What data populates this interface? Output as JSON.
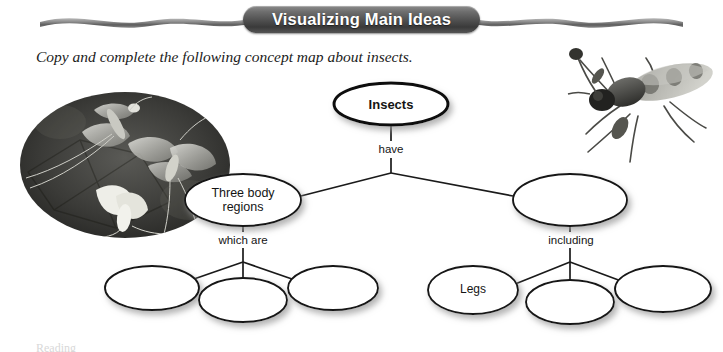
{
  "page": {
    "background": "#ffffff",
    "width": 723,
    "height": 352
  },
  "header": {
    "title": "Visualizing Main Ideas",
    "pill_color": "#4e4e4e",
    "text_color": "#ffffff",
    "ribbon_color": "#7c7c7c"
  },
  "instruction": {
    "text": "Copy and complete the following concept map about insects."
  },
  "images": {
    "left_photo": {
      "alt": "mayflies-photograph",
      "shape": "oval",
      "tone": "grayscale-dark"
    },
    "right_photo": {
      "alt": "long-legged-fly-photograph",
      "shape": "rectangle",
      "tone": "grayscale-light"
    }
  },
  "concept_map": {
    "root": {
      "label": "Insects"
    },
    "connectors": [
      {
        "id": "have",
        "label": "have"
      },
      {
        "id": "which-are",
        "label": "which are"
      },
      {
        "id": "including",
        "label": "including"
      }
    ],
    "level_two": [
      {
        "id": "three-body-regions",
        "label": "Three body\nregions",
        "filled": true
      },
      {
        "id": "level-two-blank",
        "label": "",
        "filled": false
      }
    ],
    "level_three_left": [
      {
        "id": "blank-l1",
        "label": "",
        "filled": false
      },
      {
        "id": "blank-l2",
        "label": "",
        "filled": false
      },
      {
        "id": "blank-l3",
        "label": "",
        "filled": false
      }
    ],
    "level_three_right": [
      {
        "id": "legs",
        "label": "Legs",
        "filled": true
      },
      {
        "id": "blank-r2",
        "label": "",
        "filled": false
      },
      {
        "id": "blank-r3",
        "label": "",
        "filled": false
      }
    ],
    "style": {
      "oval_fill": "#ffffff",
      "oval_stroke": "#111111",
      "line_color": "#1a1a1a"
    }
  },
  "footer": {
    "clipped_text": "Reading"
  }
}
